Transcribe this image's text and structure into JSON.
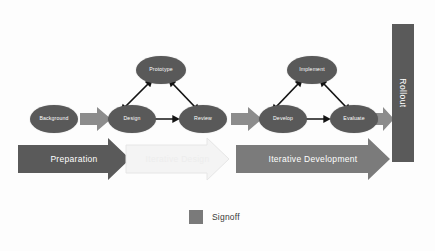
{
  "diagram": {
    "colors": {
      "node_fill": "#595959",
      "banner_dark": "#5a5a5a",
      "banner_mid": "#7b7b7b",
      "banner_faded": "#f2f2f2",
      "connector": "#8c8c8c",
      "arrow_black": "#141414",
      "legend_swatch": "#7a7a7a",
      "background": "#fdfdfd"
    },
    "nodes": [
      {
        "id": "background",
        "label": "Background"
      },
      {
        "id": "design",
        "label": "Design"
      },
      {
        "id": "prototype",
        "label": "Prototype"
      },
      {
        "id": "review",
        "label": "Review"
      },
      {
        "id": "develop",
        "label": "Develop"
      },
      {
        "id": "implement",
        "label": "Implement"
      },
      {
        "id": "evaluate",
        "label": "Evaluate"
      }
    ],
    "banners": [
      {
        "id": "preparation",
        "label": "Preparation",
        "style": "dark"
      },
      {
        "id": "iterative-design",
        "label": "Iterative Design",
        "style": "faded"
      },
      {
        "id": "iterative-development",
        "label": "Iterative Development",
        "style": "mid"
      }
    ],
    "rollout": {
      "label": "Rollout"
    },
    "legend": {
      "label": "Signoff"
    }
  }
}
